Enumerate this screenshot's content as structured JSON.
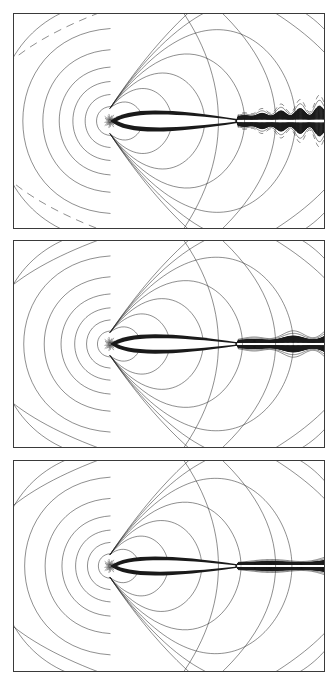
{
  "figure": {
    "name": "airfoil-contour-panels",
    "background": "#ffffff",
    "line_color": "#1a1a1a",
    "border_color": "#3a3a3a",
    "width": 336,
    "height": 680,
    "panel_count": 3
  },
  "panels": [
    {
      "id": "panel-a",
      "label": "",
      "x": 13,
      "y": 13,
      "w": 312,
      "h": 216,
      "outer_contour_style": "dashed",
      "wake_style": "oscillatory-broken",
      "wake_extent": 1.0,
      "description": "Contour plot with broken/dashed far-field contours and an irregular oscillating wake downstream of the airfoil"
    },
    {
      "id": "panel-b",
      "label": "",
      "x": 13,
      "y": 240,
      "w": 312,
      "h": 208,
      "outer_contour_style": "solid",
      "wake_style": "thick-smooth",
      "wake_extent": 1.0,
      "description": "Contour plot with smooth closed far-field contours and a thick continuous wake"
    },
    {
      "id": "panel-c",
      "label": "",
      "x": 13,
      "y": 460,
      "w": 312,
      "h": 212,
      "outer_contour_style": "solid",
      "wake_style": "thin-clean",
      "wake_extent": 1.0,
      "description": "Contour plot with smooth closed far-field contours and the cleanest, thinnest wake"
    }
  ],
  "chart_data": {
    "type": "line",
    "title": "",
    "subtitle": "",
    "xlabel": "",
    "ylabel": "",
    "xlim": [
      0,
      1
    ],
    "ylim": [
      0,
      1
    ],
    "grid": false,
    "legend": "none",
    "plot_kind": "contour",
    "series": [
      {
        "name": "panel-a-contours",
        "panel": "panel-a",
        "contour_levels": 14,
        "stagnation_point": [
          0.31,
          0.5
        ],
        "airfoil_chord": [
          0.31,
          0.72
        ],
        "airfoil_max_thickness": 0.055,
        "lobe_radii_left": [
          0.03,
          0.055,
          0.082,
          0.112,
          0.148,
          0.192,
          0.25,
          0.33,
          0.44
        ],
        "lobe_radii_right": [
          0.045,
          0.085,
          0.13,
          0.185,
          0.255,
          0.345,
          0.47
        ],
        "far_field_dashed": true,
        "wake_amplitude": 0.075,
        "wake_oscillations": 9
      },
      {
        "name": "panel-b-contours",
        "panel": "panel-b",
        "contour_levels": 14,
        "stagnation_point": [
          0.31,
          0.5
        ],
        "airfoil_chord": [
          0.31,
          0.72
        ],
        "airfoil_max_thickness": 0.052,
        "lobe_radii_left": [
          0.028,
          0.052,
          0.078,
          0.108,
          0.145,
          0.19,
          0.248,
          0.328,
          0.438
        ],
        "lobe_radii_right": [
          0.042,
          0.082,
          0.128,
          0.182,
          0.252,
          0.342,
          0.468
        ],
        "far_field_dashed": false,
        "wake_amplitude": 0.05,
        "wake_oscillations": 4
      },
      {
        "name": "panel-c-contours",
        "panel": "panel-c",
        "contour_levels": 14,
        "stagnation_point": [
          0.31,
          0.5
        ],
        "airfoil_chord": [
          0.31,
          0.72
        ],
        "airfoil_max_thickness": 0.05,
        "lobe_radii_left": [
          0.026,
          0.05,
          0.076,
          0.106,
          0.143,
          0.188,
          0.246,
          0.326,
          0.436
        ],
        "lobe_radii_right": [
          0.04,
          0.08,
          0.126,
          0.18,
          0.25,
          0.34,
          0.466
        ],
        "far_field_dashed": false,
        "wake_amplitude": 0.032,
        "wake_oscillations": 2
      }
    ],
    "annotations": []
  }
}
